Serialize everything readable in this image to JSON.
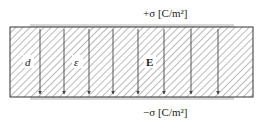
{
  "diagram": {
    "top_plate": {
      "label": "+σ [C/m²]",
      "charge_sign": "+",
      "symbol": "σ",
      "units": "[C/m²]"
    },
    "bottom_plate": {
      "label": "−σ [C/m²]",
      "charge_sign": "−",
      "symbol": "σ",
      "units": "[C/m²]"
    },
    "region_labels": {
      "separation": "d",
      "permittivity": "ε",
      "field": "E"
    },
    "field_lines": {
      "count": 8,
      "direction": "down",
      "x_positions": [
        40,
        64,
        89,
        113,
        138,
        164,
        191,
        218
      ]
    },
    "colors": {
      "outline": "#333333",
      "hatch": "#555555",
      "plate": "#d9d9d9",
      "field_line": "#444444"
    }
  }
}
